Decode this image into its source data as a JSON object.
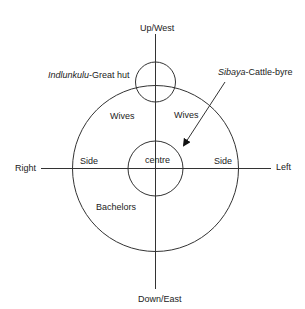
{
  "labels": {
    "top": "Up/West",
    "bottom": "Down/East",
    "right_side_label": "Right",
    "left_side_label": "Left",
    "great_hut_italic": "Indlunkulu",
    "great_hut_rest": "-Great hut",
    "cattle_italic": "Sibaya",
    "cattle_rest": "-Cattle-byre",
    "wives_left": "Wives",
    "wives_right": "Wives",
    "side_left": "Side",
    "side_right": "Side",
    "centre": "centre",
    "bachelors": "Bachelors"
  },
  "colors": {
    "line": "#333333",
    "text": "#222222"
  }
}
